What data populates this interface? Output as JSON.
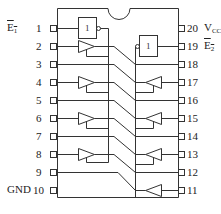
{
  "diagram": {
    "type": "ic-pinout",
    "package_pins": 20,
    "left_pins": [
      "1",
      "2",
      "3",
      "4",
      "5",
      "6",
      "7",
      "8",
      "9",
      "10"
    ],
    "right_pins": [
      "20",
      "19",
      "18",
      "17",
      "16",
      "15",
      "14",
      "13",
      "12",
      "11"
    ],
    "signals": {
      "e1": {
        "main": "E",
        "sub": "1"
      },
      "e2": {
        "main": "E",
        "sub": "2"
      },
      "vcc": {
        "main": "V",
        "sub": "CC"
      },
      "gnd": "GND"
    },
    "gates": {
      "inverter_1_label": "1",
      "inverter_2_label": "1"
    },
    "line_color": "#333333"
  }
}
